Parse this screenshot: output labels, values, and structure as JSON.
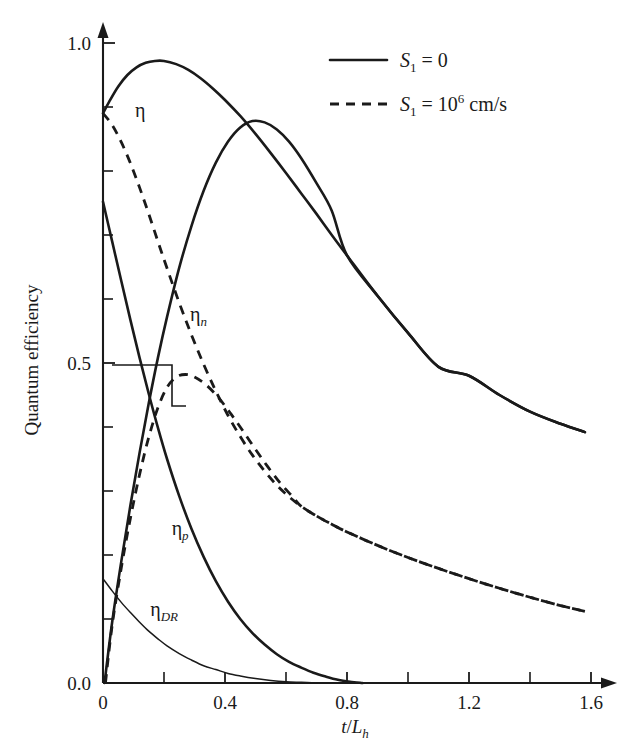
{
  "chart_data": {
    "type": "line",
    "title": "",
    "xlabel": "t/L_h",
    "ylabel": "Quantum efficiency",
    "xlim": [
      0,
      1.66
    ],
    "ylim": [
      0,
      1.05
    ],
    "grid": false,
    "legend_position": "top-right",
    "x_ticks": [
      {
        "value": 0,
        "label": "0",
        "major": true
      },
      {
        "value": 0.2,
        "label": "",
        "major": false
      },
      {
        "value": 0.4,
        "label": "0.4",
        "major": true
      },
      {
        "value": 0.6,
        "label": "",
        "major": false
      },
      {
        "value": 0.8,
        "label": "0.8",
        "major": true
      },
      {
        "value": 1.0,
        "label": "",
        "major": false
      },
      {
        "value": 1.2,
        "label": "1.2",
        "major": true
      },
      {
        "value": 1.4,
        "label": "",
        "major": false
      },
      {
        "value": 1.6,
        "label": "1.6",
        "major": true
      }
    ],
    "y_ticks": [
      {
        "value": 0.0,
        "label": "0.0",
        "major": true
      },
      {
        "value": 0.1,
        "label": "",
        "major": false
      },
      {
        "value": 0.2,
        "label": "",
        "major": false
      },
      {
        "value": 0.3,
        "label": "",
        "major": false
      },
      {
        "value": 0.4,
        "label": "",
        "major": false
      },
      {
        "value": 0.5,
        "label": "0.5",
        "major": true
      },
      {
        "value": 0.6,
        "label": "",
        "major": false
      },
      {
        "value": 0.7,
        "label": "",
        "major": false
      },
      {
        "value": 0.8,
        "label": "",
        "major": false
      },
      {
        "value": 0.9,
        "label": "",
        "major": false
      },
      {
        "value": 1.0,
        "label": "1.0",
        "major": true
      }
    ],
    "series": [
      {
        "name": "eta-total-solid",
        "style": "solid",
        "width": "thick",
        "points": [
          [
            0.0,
            0.89
          ],
          [
            0.02,
            0.908
          ],
          [
            0.05,
            0.932
          ],
          [
            0.08,
            0.95
          ],
          [
            0.11,
            0.962
          ],
          [
            0.14,
            0.969
          ],
          [
            0.17,
            0.972
          ],
          [
            0.2,
            0.972
          ],
          [
            0.24,
            0.967
          ],
          [
            0.28,
            0.958
          ],
          [
            0.32,
            0.945
          ],
          [
            0.36,
            0.929
          ],
          [
            0.4,
            0.911
          ],
          [
            0.45,
            0.886
          ],
          [
            0.5,
            0.858
          ],
          [
            0.55,
            0.828
          ],
          [
            0.6,
            0.797
          ],
          [
            0.65,
            0.765
          ],
          [
            0.7,
            0.733
          ],
          [
            0.75,
            0.7
          ],
          [
            0.8,
            0.668
          ],
          [
            0.9,
            0.605
          ],
          [
            1.0,
            0.547
          ],
          [
            1.1,
            0.494
          ],
          [
            1.2,
            0.48
          ],
          [
            1.3,
            0.45
          ],
          [
            1.4,
            0.424
          ],
          [
            1.5,
            0.405
          ],
          [
            1.58,
            0.392
          ]
        ]
      },
      {
        "name": "eta-n-solid",
        "style": "solid",
        "width": "thick",
        "points": [
          [
            0.005,
            0.0
          ],
          [
            0.03,
            0.095
          ],
          [
            0.06,
            0.19
          ],
          [
            0.09,
            0.278
          ],
          [
            0.12,
            0.36
          ],
          [
            0.15,
            0.437
          ],
          [
            0.18,
            0.508
          ],
          [
            0.21,
            0.572
          ],
          [
            0.25,
            0.649
          ],
          [
            0.29,
            0.714
          ],
          [
            0.33,
            0.769
          ],
          [
            0.37,
            0.813
          ],
          [
            0.41,
            0.846
          ],
          [
            0.45,
            0.868
          ],
          [
            0.49,
            0.878
          ],
          [
            0.53,
            0.876
          ],
          [
            0.57,
            0.865
          ],
          [
            0.61,
            0.846
          ],
          [
            0.65,
            0.82
          ],
          [
            0.7,
            0.781
          ],
          [
            0.75,
            0.738
          ],
          [
            0.8,
            0.668
          ],
          [
            0.9,
            0.605
          ],
          [
            1.0,
            0.547
          ],
          [
            1.1,
            0.494
          ],
          [
            1.2,
            0.48
          ],
          [
            1.3,
            0.45
          ],
          [
            1.4,
            0.424
          ],
          [
            1.5,
            0.405
          ],
          [
            1.58,
            0.392
          ]
        ]
      },
      {
        "name": "eta-p-solid",
        "style": "solid",
        "width": "thick",
        "points": [
          [
            0.0,
            0.752
          ],
          [
            0.03,
            0.69
          ],
          [
            0.06,
            0.628
          ],
          [
            0.09,
            0.567
          ],
          [
            0.12,
            0.508
          ],
          [
            0.15,
            0.452
          ],
          [
            0.18,
            0.399
          ],
          [
            0.21,
            0.35
          ],
          [
            0.25,
            0.292
          ],
          [
            0.29,
            0.241
          ],
          [
            0.33,
            0.197
          ],
          [
            0.37,
            0.159
          ],
          [
            0.41,
            0.127
          ],
          [
            0.45,
            0.1
          ],
          [
            0.49,
            0.078
          ],
          [
            0.53,
            0.06
          ],
          [
            0.57,
            0.045
          ],
          [
            0.61,
            0.033
          ],
          [
            0.65,
            0.024
          ],
          [
            0.69,
            0.016
          ],
          [
            0.73,
            0.01
          ],
          [
            0.77,
            0.005
          ],
          [
            0.81,
            0.002
          ],
          [
            0.85,
            0.0
          ]
        ]
      },
      {
        "name": "eta-dr-solid-thin",
        "style": "solid",
        "width": "thin",
        "points": [
          [
            0.0,
            0.163
          ],
          [
            0.03,
            0.144
          ],
          [
            0.06,
            0.126
          ],
          [
            0.09,
            0.11
          ],
          [
            0.12,
            0.095
          ],
          [
            0.15,
            0.081
          ],
          [
            0.18,
            0.069
          ],
          [
            0.21,
            0.058
          ],
          [
            0.25,
            0.046
          ],
          [
            0.29,
            0.036
          ],
          [
            0.33,
            0.027
          ],
          [
            0.37,
            0.021
          ],
          [
            0.41,
            0.015
          ],
          [
            0.45,
            0.011
          ],
          [
            0.5,
            0.007
          ],
          [
            0.55,
            0.004
          ],
          [
            0.6,
            0.002
          ],
          [
            0.65,
            0.001
          ],
          [
            0.7,
            0.0
          ]
        ]
      },
      {
        "name": "eta-total-dashed",
        "style": "dashed",
        "width": "thick",
        "points": [
          [
            0.0,
            0.89
          ],
          [
            0.03,
            0.872
          ],
          [
            0.06,
            0.845
          ],
          [
            0.09,
            0.812
          ],
          [
            0.12,
            0.774
          ],
          [
            0.15,
            0.733
          ],
          [
            0.18,
            0.69
          ],
          [
            0.21,
            0.648
          ],
          [
            0.25,
            0.594
          ],
          [
            0.29,
            0.544
          ],
          [
            0.33,
            0.498
          ],
          [
            0.37,
            0.456
          ],
          [
            0.41,
            0.418
          ],
          [
            0.45,
            0.385
          ],
          [
            0.49,
            0.356
          ],
          [
            0.53,
            0.331
          ],
          [
            0.57,
            0.309
          ],
          [
            0.61,
            0.291
          ],
          [
            0.65,
            0.276
          ],
          [
            0.7,
            0.261
          ],
          [
            0.75,
            0.248
          ],
          [
            0.8,
            0.236
          ],
          [
            0.9,
            0.215
          ],
          [
            1.0,
            0.196
          ],
          [
            1.1,
            0.179
          ],
          [
            1.2,
            0.163
          ],
          [
            1.3,
            0.148
          ],
          [
            1.4,
            0.134
          ],
          [
            1.5,
            0.121
          ],
          [
            1.58,
            0.112
          ]
        ]
      },
      {
        "name": "eta-n-dashed",
        "style": "dashed",
        "width": "thick",
        "points": [
          [
            0.008,
            0.0
          ],
          [
            0.03,
            0.09
          ],
          [
            0.06,
            0.18
          ],
          [
            0.09,
            0.258
          ],
          [
            0.12,
            0.326
          ],
          [
            0.15,
            0.384
          ],
          [
            0.18,
            0.43
          ],
          [
            0.21,
            0.462
          ],
          [
            0.24,
            0.478
          ],
          [
            0.27,
            0.482
          ],
          [
            0.3,
            0.478
          ],
          [
            0.34,
            0.465
          ],
          [
            0.38,
            0.445
          ],
          [
            0.42,
            0.42
          ],
          [
            0.46,
            0.393
          ],
          [
            0.5,
            0.365
          ],
          [
            0.54,
            0.338
          ],
          [
            0.58,
            0.313
          ],
          [
            0.62,
            0.292
          ],
          [
            0.65,
            0.276
          ],
          [
            0.7,
            0.261
          ],
          [
            0.75,
            0.248
          ],
          [
            0.8,
            0.236
          ],
          [
            0.9,
            0.215
          ],
          [
            1.0,
            0.196
          ],
          [
            1.1,
            0.179
          ],
          [
            1.2,
            0.163
          ],
          [
            1.3,
            0.148
          ],
          [
            1.4,
            0.134
          ],
          [
            1.5,
            0.121
          ],
          [
            1.58,
            0.112
          ]
        ]
      }
    ],
    "annotations": [
      {
        "name": "eta",
        "text": "η",
        "x": 0.105,
        "y": 0.885
      },
      {
        "name": "eta-n",
        "text": "η",
        "sub": "n",
        "x": 0.285,
        "y": 0.565
      },
      {
        "name": "eta-p",
        "text": "η",
        "sub": "p",
        "x": 0.225,
        "y": 0.232
      },
      {
        "name": "eta-dr",
        "text": "η",
        "sub": "DR",
        "x": 0.155,
        "y": 0.105
      }
    ],
    "legend": [
      {
        "name": "legend-s1-zero",
        "style": "solid",
        "symbol": "S",
        "sub": "1",
        "eq": "= 0",
        "sup": "",
        "unit": ""
      },
      {
        "name": "legend-s1-1e6",
        "style": "dashed",
        "symbol": "S",
        "sub": "1",
        "eq": "= 10",
        "sup": "6",
        "unit": "cm/s"
      }
    ]
  },
  "colors": {
    "ink": "#1a1a1a",
    "background": "#ffffff"
  }
}
